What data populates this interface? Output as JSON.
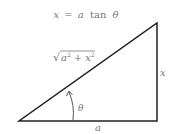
{
  "title": {
    "lhs": "x",
    "eq": "=",
    "a": "a",
    "fn": "tan",
    "theta": "θ"
  },
  "hypotenuse_label": {
    "radical": "√",
    "a": "a",
    "a_exp": "2",
    "plus": "+",
    "x": "x",
    "x_exp": "2"
  },
  "opposite_label": "x",
  "adjacent_label": "a",
  "angle_label": "θ",
  "colors": {
    "line": "#222222",
    "text": "#777777"
  }
}
